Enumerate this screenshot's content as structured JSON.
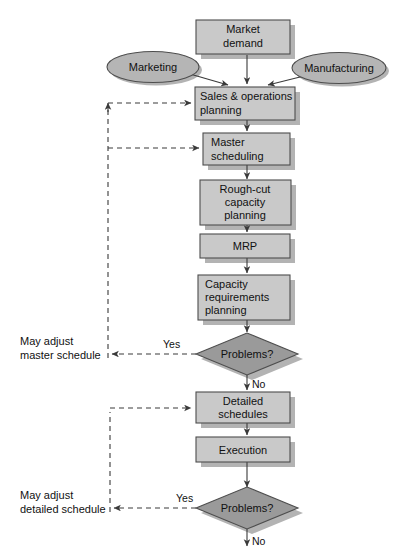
{
  "diagram": {
    "colors": {
      "process_fill": "#c9c9c9",
      "process_stroke": "#4d4d4d",
      "decision_fill": "#9a9a9a",
      "decision_stroke": "#4d4d4d",
      "terminator_fill": "#b5b5b5",
      "terminator_stroke": "#4d4d4d",
      "shadow": "#b0b0b0",
      "line": "#3a3a3a",
      "text": "#111111",
      "background": "#ffffff"
    },
    "nodes": {
      "market_demand": {
        "label_line1": "Market",
        "label_line2": "demand",
        "shape": "process"
      },
      "marketing": {
        "label": "Marketing",
        "shape": "ellipse"
      },
      "manufacturing": {
        "label": "Manufacturing",
        "shape": "ellipse"
      },
      "sales_ops": {
        "label_line1": "Sales & operations",
        "label_line2": "planning",
        "shape": "process"
      },
      "master_scheduling": {
        "label_line1": "Master",
        "label_line2": "scheduling",
        "shape": "process"
      },
      "rough_cut": {
        "label_line1": "Rough-cut",
        "label_line2": "capacity",
        "label_line3": "planning",
        "shape": "process"
      },
      "mrp": {
        "label": "MRP",
        "shape": "process"
      },
      "capacity_req": {
        "label_line1": "Capacity",
        "label_line2": "requirements",
        "label_line3": "planning",
        "shape": "process"
      },
      "problems_1": {
        "label": "Problems?",
        "shape": "decision"
      },
      "detailed_schedules": {
        "label_line1": "Detailed",
        "label_line2": "schedules",
        "shape": "process"
      },
      "execution": {
        "label": "Execution",
        "shape": "process"
      },
      "problems_2": {
        "label": "Problems?",
        "shape": "decision"
      }
    },
    "edge_labels": {
      "yes_1": "Yes",
      "no_1": "No",
      "yes_2": "Yes",
      "no_2": "No"
    },
    "side_labels": {
      "adjust_master_line1": "May adjust",
      "adjust_master_line2": "master schedule",
      "adjust_detailed_line1": "May adjust",
      "adjust_detailed_line2": "detailed schedule"
    }
  }
}
